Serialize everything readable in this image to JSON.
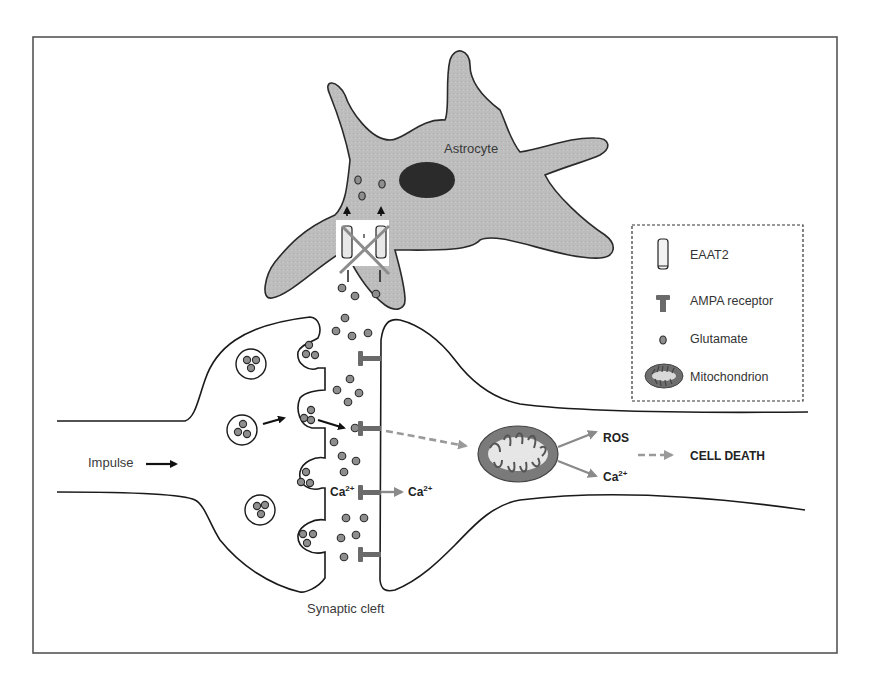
{
  "figure": {
    "frame": {
      "x": 33,
      "y": 37,
      "width": 804,
      "height": 616,
      "border_color": "#555555"
    },
    "labels": {
      "astrocyte": "Astrocyte",
      "impulse": "Impulse",
      "synaptic_cleft": "Synaptic cleft",
      "ca_cleft": "Ca",
      "ca_cleft_sup": "2+",
      "ca_post": "Ca",
      "ca_post_sup": "2+",
      "ros": "ROS",
      "ca_mito": "Ca",
      "ca_mito_sup": "2+",
      "cell_death": "CELL DEATH"
    },
    "legend": {
      "items": [
        {
          "icon": "eaat2-transporter-icon",
          "label": "EAAT2"
        },
        {
          "icon": "ampa-receptor-icon",
          "label": "AMPA receptor"
        },
        {
          "icon": "glutamate-icon",
          "label": "Glutamate"
        },
        {
          "icon": "mitochondrion-icon",
          "label": "Mitochondrion"
        }
      ]
    },
    "colors": {
      "astrocyte_fill": "#bdbdbd",
      "nucleus_fill": "#2b2b2b",
      "glutamate_fill": "#8e8e8e",
      "ampa_fill": "#6a6a6a",
      "mitochondrion_outer": "#7a7a7a",
      "mitochondrion_inner": "#e6e6e6",
      "inhibition_cross": "#8c8c8c",
      "pathway_arrow": "#8a8a8a"
    }
  }
}
